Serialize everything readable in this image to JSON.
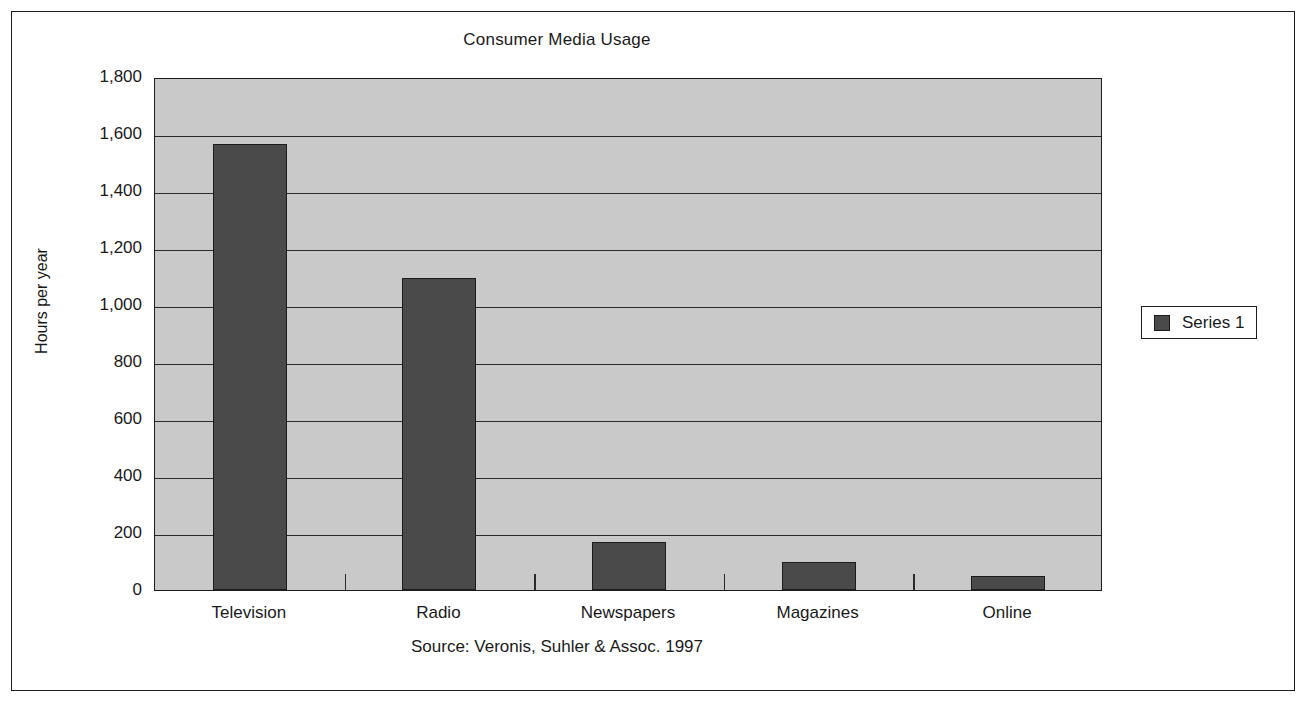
{
  "chart_data": {
    "type": "bar",
    "title": "Consumer Media Usage",
    "xlabel": "",
    "ylabel": "Hours per year",
    "categories": [
      "Television",
      "Radio",
      "Newspapers",
      "Magazines",
      "Online"
    ],
    "values": [
      1565,
      1095,
      170,
      100,
      50
    ],
    "series": [
      {
        "name": "Series 1",
        "values": [
          1565,
          1095,
          170,
          100,
          50
        ]
      }
    ],
    "ylim": [
      0,
      1800
    ],
    "ytick_step": 200,
    "ytick_labels": [
      "0",
      "200",
      "400",
      "600",
      "800",
      "1,000",
      "1,200",
      "1,400",
      "1,600",
      "1,800"
    ],
    "ytick_values": [
      0,
      200,
      400,
      600,
      800,
      1000,
      1200,
      1400,
      1600,
      1800
    ],
    "grid": true,
    "legend_position": "right",
    "source_note": "Source: Veronis, Suhler & Assoc. 1997",
    "colors": {
      "bar_fill": "#4a4a4a",
      "bar_outline": "#1c1c1c",
      "plot_background": "#c9c9c9",
      "gridline": "#2a2a2a",
      "frame_border": "#1c1c1c",
      "page_background": "#ffffff",
      "text": "#1a1a1a"
    }
  },
  "legend": {
    "entries": [
      {
        "label": "Series 1",
        "swatch_color": "#4a4a4a"
      }
    ]
  }
}
